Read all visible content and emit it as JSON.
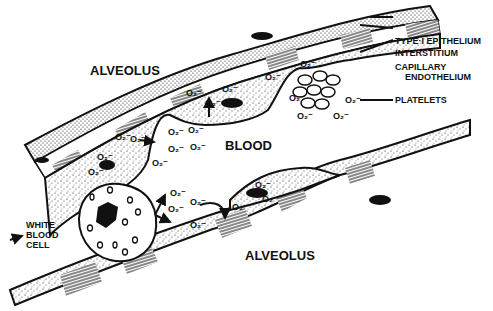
{
  "diagram": {
    "labels": {
      "alveolus_top": "ALVEOLUS",
      "alveolus_bottom": "ALVEOLUS",
      "blood": "BLOOD",
      "type1_epithelium": "TYPE·I  EPITHELIUM",
      "interstitium": "INTERSTITIUM",
      "capillary": "CAPILLARY",
      "endothelium": "ENDOTHELIUM",
      "platelets": "PLATELETS",
      "white": "WHITE",
      "blood_word": "BLOOD",
      "cell": "CELL"
    },
    "o2_symbol": "O₂⁻",
    "colors": {
      "ink": "#111111",
      "paper": "#ffffff"
    }
  }
}
